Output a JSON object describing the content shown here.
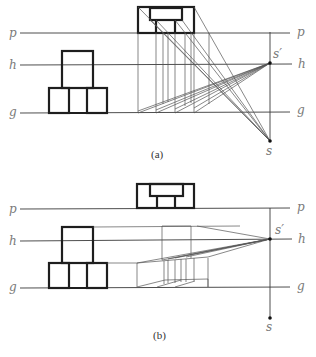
{
  "figure": {
    "type": "perspective-construction-diagram",
    "panels": [
      {
        "id": "a",
        "caption": "(a)",
        "line_labels_left": {
          "p": "p",
          "h": "h",
          "g": "g"
        },
        "line_labels_right": {
          "p": "p",
          "h": "h",
          "g": "g"
        },
        "points": {
          "station_point": "s",
          "vanishing_point": "s′"
        }
      },
      {
        "id": "b",
        "caption": "(b)",
        "line_labels_left": {
          "p": "p",
          "h": "h",
          "g": "g"
        },
        "line_labels_right": {
          "p": "p",
          "h": "h",
          "g": "g"
        },
        "points": {
          "station_point": "s",
          "vanishing_point": "s′"
        }
      }
    ],
    "colors": {
      "heavy_line": "#1e1e1e",
      "construction_line": "#555555",
      "label": "#7a7a7a"
    }
  }
}
